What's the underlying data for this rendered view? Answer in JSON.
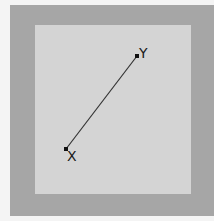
{
  "diagram": {
    "colors": {
      "background": "#f4f4f4",
      "outer_frame": "#a6a6a6",
      "inner_panel": "#d4d4d4",
      "line": "#333333",
      "point": "#111111"
    },
    "points": [
      {
        "id": "X",
        "label": "X",
        "x": 66,
        "y": 149
      },
      {
        "id": "Y",
        "label": "Y",
        "x": 137,
        "y": 56
      }
    ],
    "segment": {
      "from": "X",
      "to": "Y"
    }
  }
}
